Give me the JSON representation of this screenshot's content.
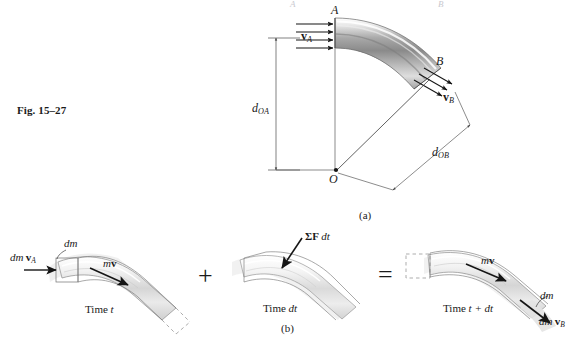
{
  "figure": {
    "number_label": "Fig. 15–27",
    "part_a_label": "(a)",
    "part_b_label": "(b)"
  },
  "diagram_a": {
    "point_A_label": "A",
    "point_B_label": "B",
    "point_O_label": "O",
    "velocity_in": {
      "symbol": "v",
      "subscript": "A"
    },
    "velocity_out": {
      "symbol": "v",
      "subscript": "B"
    },
    "moment_arm_in": {
      "symbol": "d",
      "subscript": "OA"
    },
    "moment_arm_out": {
      "symbol": "d",
      "subscript": "OB"
    }
  },
  "diagram_b": {
    "panels": [
      {
        "caption_prefix": "Time ",
        "caption_var": "t",
        "mass_flux_in": {
          "dm": "dm",
          "symbol": "v",
          "subscript": "A"
        },
        "element_label": "dm",
        "momentum_label": {
          "m": "m",
          "symbol": "v"
        }
      },
      {
        "caption_prefix": "Time ",
        "caption_var": "dt",
        "impulse_label": {
          "sigma": "Σ",
          "force": "F",
          "dt": "dt"
        }
      },
      {
        "caption_prefix": "Time ",
        "caption_var": "t + dt",
        "momentum_label": {
          "m": "m",
          "symbol": "v"
        },
        "element_label": "dm",
        "mass_flux_out": {
          "dm": "dm",
          "symbol": "v",
          "subscript": "B"
        }
      }
    ],
    "operators": {
      "plus": "+",
      "equals": "="
    }
  },
  "colors": {
    "ink": "#1a1a1a",
    "line": "#2b2b2b",
    "pipe_light": "#fbfbfb",
    "pipe_mid": "#b9b9b9",
    "pipe_dark": "#6e6e6e",
    "pipe_outline": "#5a5a5a",
    "ghost_fill": "#e9e9e9",
    "dim_line": "#4a4a4a",
    "dashed": "#7a7a7a"
  }
}
